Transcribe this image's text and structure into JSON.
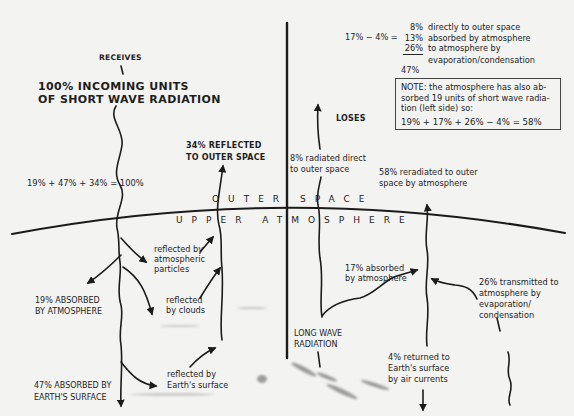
{
  "diagram": {
    "type": "earth-atmosphere-energy-balance",
    "divider_label_outer": "OUTER SPACE",
    "divider_label_upper": "UPPER ATMOSPHERE",
    "left_side": {
      "receives_label": "RECEIVES",
      "incoming_title_line1": "100% INCOMING UNITS",
      "incoming_title_line2": "OF SHORT WAVE RADIATION",
      "sum_equation": "19% + 47% + 34% = 100%",
      "reflected_title_line1": "34% REFLECTED",
      "reflected_title_line2": "TO OUTER SPACE",
      "absorbed_atmosphere_line1": "19% ABSORBED",
      "absorbed_atmosphere_line2": "BY ATMOSPHERE",
      "absorbed_surface_line1": "47% ABSORBED BY",
      "absorbed_surface_line2": "EARTH'S SURFACE",
      "reflected_particles_line1": "reflected by",
      "reflected_particles_line2": "atmospheric",
      "reflected_particles_line3": "particles",
      "reflected_clouds_line1": "reflected",
      "reflected_clouds_line2": "by clouds",
      "reflected_surface_line1": "reflected by",
      "reflected_surface_line2": "Earth's surface"
    },
    "right_side": {
      "loses_label": "LOSES",
      "equation_prefix": "17% − 4% =",
      "breakdown": [
        {
          "pct": "8%",
          "text": "directly to outer space"
        },
        {
          "pct": "13%",
          "text": "absorbed by atmosphere"
        },
        {
          "pct": "26%",
          "text": "to atmosphere by"
        },
        {
          "pct": "",
          "text": "evaporation/condensation"
        }
      ],
      "breakdown_total": "47%",
      "note_line1": "NOTE: the atmosphere has also ab-",
      "note_line2": "sorbed 19 units of short wave radia-",
      "note_line3": "tion (left side) so:",
      "note_equation": "19% + 17% + 26% − 4% = 58%",
      "radiated_direct_line1": "8% radiated direct",
      "radiated_direct_line2": "to outer space",
      "reradiated_line1": "58% reradiated to outer",
      "reradiated_line2": "space by atmosphere",
      "absorbed_17_line1": "17% absorbed",
      "absorbed_17_line2": "by atmosphere",
      "transmitted_26_line1": "26% transmitted to",
      "transmitted_26_line2": "atmosphere by",
      "transmitted_26_line3": "evaporation/",
      "transmitted_26_line4": "condensation",
      "long_wave_line1": "LONG WAVE",
      "long_wave_line2": "RADIATION",
      "returned_4_line1": "4% returned to",
      "returned_4_line2": "Earth's surface",
      "returned_4_line3": "by air currents"
    },
    "colors": {
      "background": "#f3f3f1",
      "ink": "#1b1b1b"
    }
  }
}
